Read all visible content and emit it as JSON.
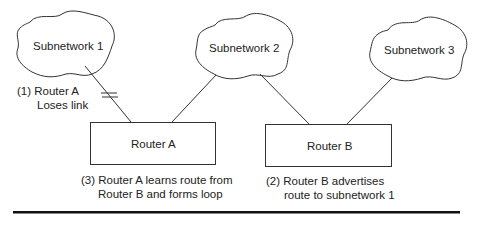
{
  "diagram": {
    "type": "network-routing-loop",
    "subnetworks": [
      {
        "id": "subnet1",
        "label": "Subnetwork 1"
      },
      {
        "id": "subnet2",
        "label": "Subnetwork 2"
      },
      {
        "id": "subnet3",
        "label": "Subnetwork 3"
      }
    ],
    "routers": [
      {
        "id": "routerA",
        "label": "Router A"
      },
      {
        "id": "routerB",
        "label": "Router B"
      }
    ],
    "links": [
      {
        "from": "subnet1",
        "to": "routerA",
        "state": "broken"
      },
      {
        "from": "subnet2",
        "to": "routerA",
        "state": "up"
      },
      {
        "from": "subnet2",
        "to": "routerB",
        "state": "up"
      },
      {
        "from": "subnet3",
        "to": "routerB",
        "state": "up"
      }
    ],
    "annotations": {
      "step1": {
        "line1": "(1) Router A",
        "line2": "Loses link"
      },
      "step2": {
        "line1": "(2) Router B advertises",
        "line2": "route to subnetwork 1"
      },
      "step3": {
        "line1": "(3) Router A learns route from",
        "line2": "Router B and forms loop"
      }
    },
    "colors": {
      "line": "#333333",
      "rule": "#111111",
      "background": "#ffffff"
    }
  }
}
